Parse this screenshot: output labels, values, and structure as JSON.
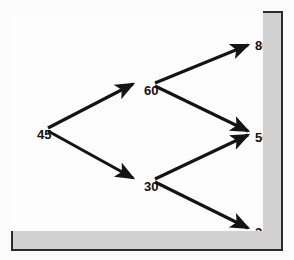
{
  "figure": {
    "type": "decision-tree-diagram",
    "frame_color": "#2b2b2b",
    "band_color": "#d2d2d2",
    "canvas_color": "#fdfdfd",
    "edge_color": "#141414",
    "text_color": "#121212"
  },
  "chart_data": {
    "type": "diagram",
    "title": "",
    "xlabel": "",
    "ylabel": "",
    "grid": false,
    "legend": "none",
    "nodes": [
      {
        "id": "root",
        "label": "45",
        "x": 26,
        "y": 117,
        "level": 0
      },
      {
        "id": "up",
        "label": "60",
        "x": 133,
        "y": 73,
        "level": 1
      },
      {
        "id": "down",
        "label": "30",
        "x": 133,
        "y": 169,
        "level": 1
      },
      {
        "id": "leaf1",
        "label": "80",
        "x": 244,
        "y": 28,
        "level": 2
      },
      {
        "id": "leaf2",
        "label": "50",
        "x": 244,
        "y": 120,
        "level": 2
      },
      {
        "id": "leaf3",
        "label": "20",
        "x": 244,
        "y": 215,
        "level": 2
      }
    ],
    "edges": [
      {
        "from": "root",
        "to": "up",
        "x1": 37,
        "y1": 117,
        "x2": 122,
        "y2": 73
      },
      {
        "from": "root",
        "to": "down",
        "x1": 37,
        "y1": 120,
        "x2": 122,
        "y2": 167
      },
      {
        "from": "up",
        "to": "leaf1",
        "x1": 144,
        "y1": 72,
        "x2": 237,
        "y2": 34
      },
      {
        "from": "up",
        "to": "leaf2",
        "x1": 144,
        "y1": 75,
        "x2": 237,
        "y2": 120
      },
      {
        "from": "down",
        "to": "leaf2",
        "x1": 144,
        "y1": 168,
        "x2": 237,
        "y2": 124
      },
      {
        "from": "down",
        "to": "leaf3",
        "x1": 144,
        "y1": 171,
        "x2": 237,
        "y2": 217
      }
    ]
  }
}
